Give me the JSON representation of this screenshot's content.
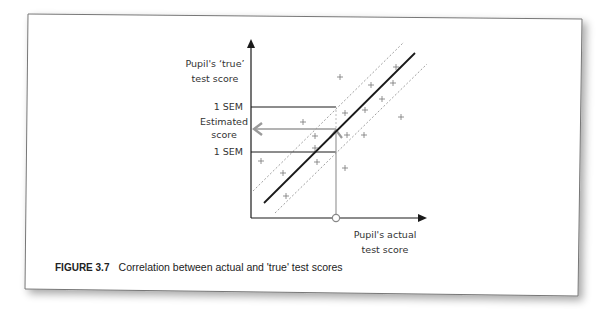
{
  "figure": {
    "number_label": "FIGURE 3.7",
    "caption": "Correlation between actual and 'true' test scores"
  },
  "axes": {
    "y_label_line1": "Pupil's ‘true’",
    "y_label_line2": "test score",
    "x_label_line1": "Pupil's actual",
    "x_label_line2": "test score"
  },
  "annotations": {
    "upper_sem": "1 SEM",
    "estimated_line1": "Estimated",
    "estimated_line2": "score",
    "lower_sem": "1 SEM"
  },
  "colors": {
    "axis": "#1a1a1a",
    "regression_line": "#1a1a1a",
    "confidence_band": "#888888",
    "guide_arrow": "#9a9a9a",
    "points": "#777777",
    "frame": "#777777"
  },
  "chart_data": {
    "type": "scatter",
    "title": "Correlation between actual and 'true' test scores",
    "xlabel": "Pupil's actual test score",
    "ylabel": "Pupil's 'true' test score",
    "grid": false,
    "points_px": [
      [
        340,
        77
      ],
      [
        371,
        85
      ],
      [
        396,
        67
      ],
      [
        393,
        83
      ],
      [
        382,
        99
      ],
      [
        365,
        110
      ],
      [
        345,
        113
      ],
      [
        401,
        117
      ],
      [
        347,
        135
      ],
      [
        364,
        135
      ],
      [
        303,
        122
      ],
      [
        315,
        136
      ],
      [
        315,
        148
      ],
      [
        317,
        162
      ],
      [
        261,
        161
      ],
      [
        283,
        173
      ],
      [
        286,
        196
      ],
      [
        345,
        168
      ]
    ],
    "regression_line_px": [
      [
        264,
        203
      ],
      [
        415,
        53
      ]
    ],
    "upper_band_px": [
      [
        253,
        191
      ],
      [
        404,
        42
      ]
    ],
    "lower_band_px": [
      [
        275,
        213
      ],
      [
        427,
        64
      ]
    ],
    "markers": {
      "actual_score_x_px": 336,
      "estimated_score_y_px": 129,
      "upper_sem_y_px": 107,
      "lower_sem_y_px": 152
    }
  }
}
